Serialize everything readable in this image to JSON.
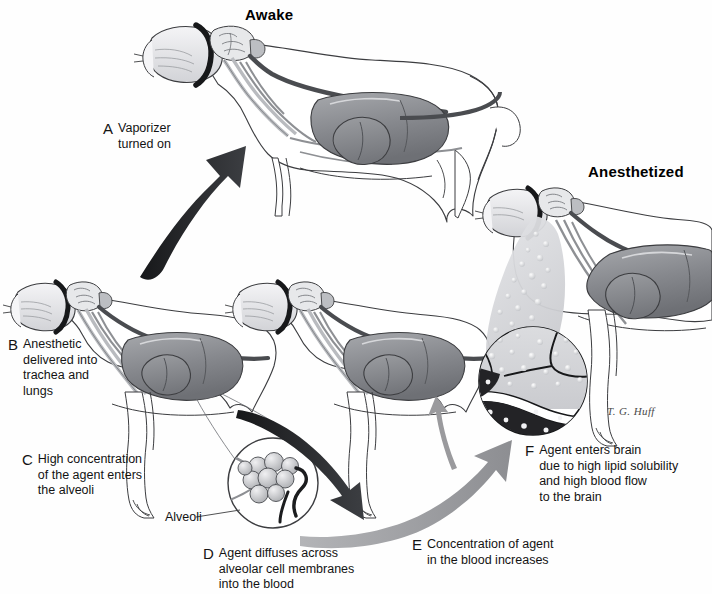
{
  "diagram": {
    "title_awake": "Awake",
    "title_anesthetized": "Anesthetized",
    "artist_signature": "T. G. Huff",
    "callout_alveoli": "Alveoli",
    "footer_caption": "",
    "steps": [
      {
        "letter": "A",
        "text": "Vaporizer\nturned on"
      },
      {
        "letter": "B",
        "text": "Anesthetic\ndelivered into\ntrachea and\nlungs"
      },
      {
        "letter": "C",
        "text": "High concentration\nof the agent enters\nthe alveoli"
      },
      {
        "letter": "D",
        "text": "Agent diffuses across\nalveolar cell membranes\ninto the blood"
      },
      {
        "letter": "E",
        "text": "Concentration of agent\nin the blood increases"
      },
      {
        "letter": "F",
        "text": "Agent enters brain\ndue to high lipid solubility\nand high blood flow\nto the brain"
      }
    ],
    "colors": {
      "background": "#fefefe",
      "ink": "#131313",
      "arrow_dark": "#2f3033",
      "arrow_gray": "#9a9a9d",
      "organ_gray": "#8e9094",
      "organ_dark": "#6c6e73",
      "vessel_dark": "#4a4c50",
      "vessel_light": "#b9bbbf",
      "body_outline": "#3c3d40",
      "mask_band": "#1a1a1c",
      "bubble_fill": "#d9dadd",
      "blood_dark": "#232326"
    }
  }
}
